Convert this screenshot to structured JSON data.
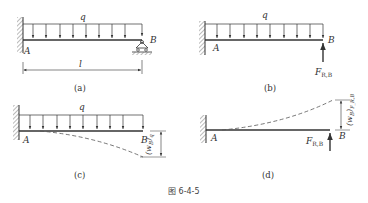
{
  "figure": {
    "caption": "图 6-4-5",
    "colors": {
      "line": "#333333",
      "hatch": "#777777",
      "background": "#ffffff"
    }
  },
  "panels": {
    "a": {
      "caption": "(a)",
      "load_label": "q",
      "point_a": "A",
      "point_b": "B",
      "length_label": "l",
      "support_b": "pin-roller"
    },
    "b": {
      "caption": "(b)",
      "load_label": "q",
      "point_a": "A",
      "point_b": "B",
      "force_label": "F",
      "force_subscript": "R,B"
    },
    "c": {
      "caption": "(c)",
      "load_label": "q",
      "point_a": "A",
      "point_b": "B",
      "deflection_label": "(w",
      "deflection_sub": "B",
      "deflection_close": ")",
      "deflection_subscript2": "q"
    },
    "d": {
      "caption": "(d)",
      "point_a": "A",
      "point_b": "B",
      "force_label": "F",
      "force_subscript": "R,B",
      "deflection_label": "(w",
      "deflection_sub": "B",
      "deflection_close": ")",
      "deflection_subscript2": "F_R,B"
    }
  }
}
